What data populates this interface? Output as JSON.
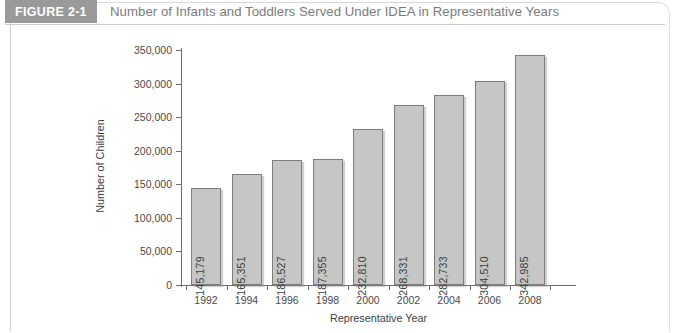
{
  "header": {
    "figure_tag": "FIGURE 2-1",
    "title": "Number of Infants and Toddlers Served Under IDEA in Representative Years"
  },
  "chart_data": {
    "type": "bar",
    "title": "Number of Infants and Toddlers Served Under IDEA in Representative Years",
    "xlabel": "Representative Year",
    "ylabel": "Number of Children",
    "categories": [
      "1992",
      "1994",
      "1996",
      "1998",
      "2000",
      "2002",
      "2004",
      "2006",
      "2008"
    ],
    "values": [
      145179,
      165351,
      186527,
      187355,
      232810,
      268331,
      282733,
      304510,
      342985
    ],
    "value_labels": [
      "145,179",
      "165,351",
      "186,527",
      "187,355",
      "232,810",
      "268,331",
      "282,733",
      "304,510",
      "342,985"
    ],
    "ylim": [
      0,
      350000
    ],
    "ytick_values": [
      0,
      50000,
      100000,
      150000,
      200000,
      250000,
      300000,
      350000
    ],
    "ytick_labels": [
      "0",
      "50,000",
      "100,000",
      "150,000",
      "200,000",
      "250,000",
      "300,000",
      "350,000"
    ],
    "grid": false,
    "legend": null,
    "bar_color": "#c6c6c6",
    "bar_border_color": "#7d7d7d",
    "axis_color": "#6e6e6e"
  },
  "colors": {
    "tag_background": "#9a9a9a",
    "tag_text": "#ffffff",
    "title_text": "#7b7b7b",
    "frame_border": "#d8d8d8"
  }
}
